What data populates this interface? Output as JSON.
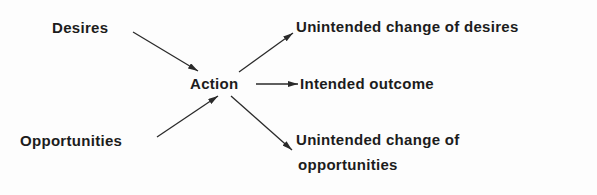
{
  "diagram": {
    "inputs": [
      {
        "label": "Desires"
      },
      {
        "label": "Opportunities"
      }
    ],
    "center": {
      "label": "Action"
    },
    "outputs": [
      {
        "label": "Unintended change of desires"
      },
      {
        "label": "Intended outcome"
      },
      {
        "label_line1": "Unintended change of",
        "label_line2": "opportunities"
      }
    ],
    "colors": {
      "text": "#1c1c1c",
      "arrow": "#2a2a2a",
      "background": "#fdfdfd"
    }
  }
}
